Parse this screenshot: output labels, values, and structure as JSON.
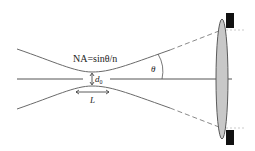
{
  "diagram": {
    "type": "gaussian-beam-focusing",
    "labels": {
      "na_formula": "NA=sinθ/n",
      "waist_diameter": "d",
      "waist_subscript": "0",
      "depth_of_focus": "L",
      "angle": "θ"
    },
    "colors": {
      "line": "#6a6a6a",
      "axis": "#555555",
      "lens_fill": "#c8c8c8",
      "lens_stroke": "#5a5a5a",
      "aperture": "#111111",
      "text": "#222222"
    }
  }
}
